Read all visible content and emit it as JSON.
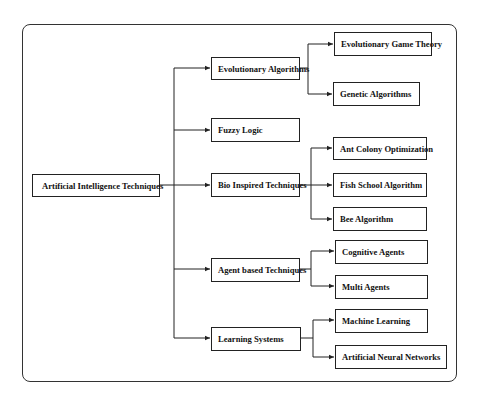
{
  "diagram": {
    "type": "tree",
    "root": {
      "label": "Artificial Intelligence Techniques",
      "children": [
        {
          "label": "Evolutionary Algorithms",
          "children": [
            {
              "label": "Evolutionary Game Theory"
            },
            {
              "label": "Genetic Algorithms"
            }
          ]
        },
        {
          "label": "Fuzzy Logic",
          "children": []
        },
        {
          "label": "Bio Inspired Techniques",
          "children": [
            {
              "label": "Ant Colony Optimization"
            },
            {
              "label": "Fish School Algorithm"
            },
            {
              "label": "Bee Algorithm"
            }
          ]
        },
        {
          "label": "Agent based Techniques",
          "children": [
            {
              "label": "Cognitive Agents"
            },
            {
              "label": "Multi Agents"
            }
          ]
        },
        {
          "label": "Learning Systems",
          "children": [
            {
              "label": "Machine Learning"
            },
            {
              "label": "Artificial Neural Networks"
            }
          ]
        }
      ]
    }
  },
  "colors": {
    "line": "#222222",
    "frame": "#333333",
    "background": "#ffffff"
  }
}
